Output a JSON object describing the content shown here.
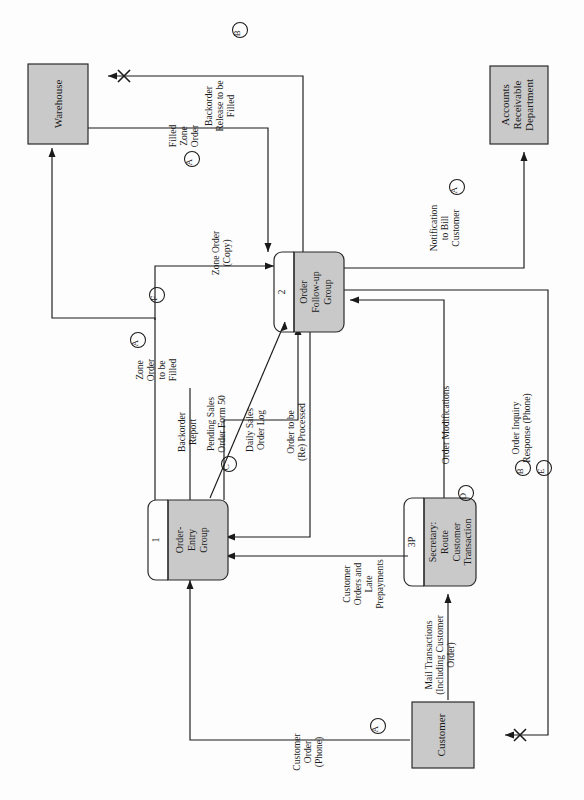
{
  "diagram": {
    "type": "data-flow-diagram",
    "orientation": "rotated-90-counterclockwise",
    "colors": {
      "entity_fill": "#c9c9c9",
      "process_fill": "#c9c9c9",
      "line": "#1a1a1a",
      "background": "#fdfdfd"
    }
  },
  "entities": [
    {
      "id": "warehouse",
      "label": "Warehouse"
    },
    {
      "id": "accounts_receivable",
      "label_lines": [
        "Accounts",
        "Receivable",
        "Department"
      ]
    },
    {
      "id": "customer",
      "label": "Customer"
    }
  ],
  "processes": [
    {
      "id": "p1",
      "number": "1",
      "label_lines": [
        "Order-",
        "Entry",
        "Group"
      ]
    },
    {
      "id": "p2",
      "number": "2",
      "label_lines": [
        "Order",
        "Follow-up",
        "Group"
      ]
    },
    {
      "id": "p3",
      "number": "3P",
      "label_lines": [
        "Secretary:",
        "Route",
        "Customer",
        "Transaction"
      ]
    }
  ],
  "flows": [
    {
      "id": "f_backorder_release",
      "label_lines": [
        "Backorder",
        "Release to be",
        "Filled"
      ],
      "marker": "B"
    },
    {
      "id": "f_filled_zone_order",
      "label_lines": [
        "Filled",
        "Zone",
        "Order"
      ],
      "marker": "A"
    },
    {
      "id": "f_zone_order_copy",
      "label_lines": [
        "Zone Order",
        "(Copy)"
      ],
      "marker": ""
    },
    {
      "id": "f_zone_order_to_be_filled",
      "label_lines": [
        "Zone",
        "Order",
        "to be",
        "Filled"
      ],
      "marker": "A",
      "marker2": "F"
    },
    {
      "id": "f_notification_to_bill",
      "label_lines": [
        "Notification",
        "to Bill",
        "Customer"
      ],
      "marker": "A"
    },
    {
      "id": "f_backorder_report",
      "label_lines": [
        "Backorder",
        "Report"
      ],
      "marker": ""
    },
    {
      "id": "f_pending_sales",
      "label_lines": [
        "Pending Sales",
        "Order Form 50"
      ],
      "marker": "C"
    },
    {
      "id": "f_daily_sales_log",
      "label_lines": [
        "Daily Sales",
        "Order Log"
      ],
      "marker": ""
    },
    {
      "id": "f_order_reprocessed",
      "label_lines": [
        "Order to be",
        "(Re) Processed"
      ],
      "marker": ""
    },
    {
      "id": "f_customer_orders_late",
      "label_lines": [
        "Customer",
        "Orders and",
        "Late",
        "Prepayments"
      ],
      "marker": ""
    },
    {
      "id": "f_order_modifications",
      "label_lines": [
        "Order Modifications"
      ],
      "marker": "D"
    },
    {
      "id": "f_order_inquiry_response",
      "label_lines": [
        "Order Inquiry",
        "Response (Phone)"
      ],
      "marker": "B",
      "marker2": "E"
    },
    {
      "id": "f_mail_transactions",
      "label_lines": [
        "Mail Transactions",
        "(Including Customer",
        "Order)"
      ],
      "marker": ""
    },
    {
      "id": "f_customer_order_phone",
      "label_lines": [
        "Customer",
        "Order",
        "(Phone)"
      ],
      "marker": "A"
    }
  ],
  "markers": [
    "A",
    "B",
    "C",
    "D",
    "E",
    "F"
  ]
}
